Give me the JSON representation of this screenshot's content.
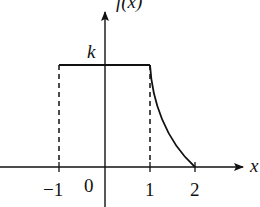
{
  "diagram": {
    "title": "f(x)",
    "x_axis_label": "x",
    "y_axis_label": "f(x)",
    "level_label": "k",
    "origin_label": "0",
    "ticks": [
      {
        "label": "-1",
        "value": -1
      },
      {
        "label": "1",
        "value": 1
      },
      {
        "label": "2",
        "value": 2
      }
    ],
    "tick_texts": {
      "neg1": "−1",
      "one": "1",
      "two": "2"
    },
    "colors": {
      "stroke": "#111111",
      "background": "#ffffff"
    }
  }
}
